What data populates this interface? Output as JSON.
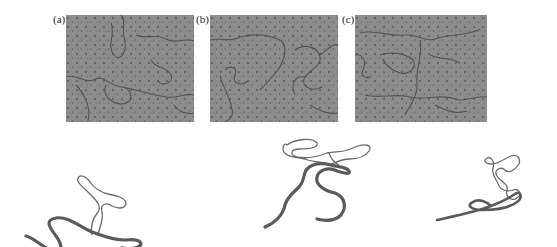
{
  "figure": {
    "panels": [
      {
        "id": "a",
        "label": "(a)",
        "type": "micrograph",
        "description": "Micrograph of filamentous strands on speckled grey background"
      },
      {
        "id": "b",
        "label": "(b)",
        "type": "micrograph",
        "description": "Micrograph of filamentous strands on speckled grey background"
      },
      {
        "id": "c",
        "label": "(c)",
        "type": "micrograph",
        "description": "Micrograph of filamentous strands on speckled grey background"
      }
    ],
    "sketches": [
      {
        "id": "a",
        "description": "Tracing: thick strand with thin looped branch"
      },
      {
        "id": "b",
        "description": "Tracing: thick S-shaped strand with thin looped branch on top"
      },
      {
        "id": "c",
        "description": "Tracing: thick diagonal strand with thin coiled branch"
      }
    ],
    "colors": {
      "micrograph_bg": "#8a8a8a",
      "thick_strand": "#5a5a5a",
      "thin_strand": "#6a6a6a"
    }
  }
}
